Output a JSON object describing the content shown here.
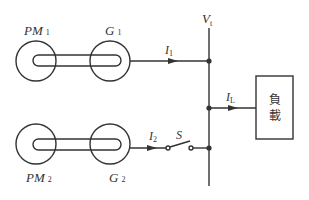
{
  "diagram": {
    "type": "circuit-schematic",
    "bus": {
      "label": "V",
      "subscript": "t"
    },
    "units": [
      {
        "motor": {
          "label": "PM",
          "subscript": "1"
        },
        "generator": {
          "label": "G",
          "subscript": "1"
        },
        "current": {
          "label": "I",
          "subscript": "1"
        }
      },
      {
        "motor": {
          "label": "PM",
          "subscript": "2"
        },
        "generator": {
          "label": "G",
          "subscript": "2"
        },
        "current": {
          "label": "I",
          "subscript": "2"
        }
      }
    ],
    "switch": {
      "label": "S"
    },
    "load": {
      "current": {
        "label": "I",
        "subscript": "L"
      },
      "label_line1": "負",
      "label_line2": "載"
    },
    "colors": {
      "stroke": "#333333",
      "background": "#ffffff"
    }
  }
}
